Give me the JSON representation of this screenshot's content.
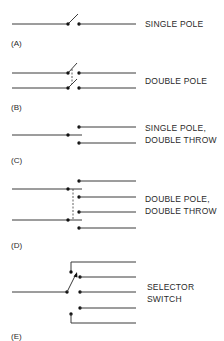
{
  "diagram": {
    "colors": {
      "wire": "#3a3a3a",
      "dot": "#111111",
      "text": "#2a2a2a",
      "background": "#ffffff"
    },
    "switches": [
      {
        "id": "A",
        "tag": "(A)",
        "label_lines": [
          "SINGLE POLE"
        ],
        "poles": 1,
        "throws": 1
      },
      {
        "id": "B",
        "tag": "(B)",
        "label_lines": [
          "DOUBLE POLE"
        ],
        "poles": 2,
        "throws": 1
      },
      {
        "id": "C",
        "tag": "(C)",
        "label_lines": [
          "SINGLE POLE,",
          "DOUBLE THROW"
        ],
        "poles": 1,
        "throws": 2
      },
      {
        "id": "D",
        "tag": "(D)",
        "label_lines": [
          "DOUBLE POLE,",
          "DOUBLE THROW"
        ],
        "poles": 2,
        "throws": 2
      },
      {
        "id": "E",
        "tag": "(E)",
        "label_lines": [
          "SELECTOR",
          "SWITCH"
        ],
        "poles": 1,
        "throws": 5
      }
    ]
  }
}
